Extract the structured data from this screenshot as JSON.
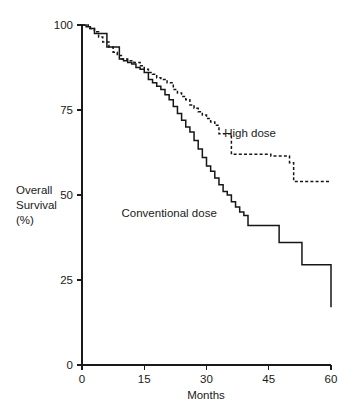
{
  "chart_data": {
    "type": "line",
    "title": "",
    "subtitle": "",
    "xlabel": "Months",
    "ylabel": "Overall Survival (%)",
    "ylabel_lines": [
      "Overall",
      "Survival",
      "(%)"
    ],
    "xlim": [
      0,
      60
    ],
    "ylim": [
      0,
      100
    ],
    "xticks": [
      0,
      15,
      30,
      45,
      60
    ],
    "xtick_labels": [
      "0",
      "15",
      "30",
      "45",
      "60"
    ],
    "yticks": [
      0,
      25,
      50,
      75,
      100
    ],
    "ytick_labels": [
      "0",
      "25",
      "50",
      "75",
      "100"
    ],
    "grid": false,
    "legend_position": "inline-annotations",
    "step_type": "post",
    "series": [
      {
        "name": "High dose",
        "style": "dashed",
        "label_text": "High dose",
        "label_x": 40.5,
        "label_y": 67,
        "x": [
          0,
          1.5,
          3,
          4,
          5,
          6.5,
          7.5,
          8.5,
          9.5,
          11,
          12.5,
          14,
          15,
          16,
          17,
          18,
          19,
          20.5,
          22,
          23,
          24,
          25,
          26,
          27,
          28,
          29,
          30,
          31,
          32,
          33,
          34,
          36,
          37,
          45.5,
          50,
          51,
          60
        ],
        "y": [
          100,
          99,
          98,
          96.5,
          95,
          93.5,
          92,
          91,
          90,
          89.5,
          89,
          88,
          87,
          86,
          85.5,
          84.5,
          84,
          83,
          81,
          80,
          79,
          78,
          76.5,
          75.5,
          74.5,
          73.5,
          72.5,
          71.5,
          70.5,
          68,
          68,
          62,
          62,
          61.5,
          59.5,
          54,
          54
        ]
      },
      {
        "name": "Conventional dose",
        "style": "solid",
        "label_text": "Conventional dose",
        "label_x": 21,
        "label_y": 43.5,
        "x": [
          0,
          1,
          2,
          3,
          5,
          6,
          8,
          9,
          10,
          11,
          12,
          13,
          14,
          15,
          16,
          17,
          18,
          19,
          20,
          21,
          22,
          23,
          24,
          25,
          26,
          27,
          28,
          29,
          30,
          31,
          32,
          33,
          34,
          35,
          36,
          37,
          38,
          39,
          40,
          46.5,
          47.5,
          50,
          53,
          60
        ],
        "y": [
          100,
          99.5,
          99,
          97.5,
          97.5,
          93.5,
          93.5,
          90,
          89.5,
          89,
          88.5,
          87.5,
          87,
          86,
          84,
          83,
          82,
          81,
          79.5,
          78,
          76,
          74,
          72,
          70,
          68.5,
          66,
          63.5,
          61,
          58.5,
          57,
          55,
          53,
          51,
          50,
          48,
          46.5,
          45,
          44,
          41,
          41,
          36,
          36,
          29.5,
          17
        ]
      }
    ],
    "annotations": [
      {
        "text": "High dose",
        "x": 40.5,
        "y": 67
      },
      {
        "text": "Conventional dose",
        "x": 21,
        "y": 43.5
      }
    ]
  },
  "axes": {
    "x_title": "Months",
    "y_title_line1": "Overall",
    "y_title_line2": "Survival",
    "y_title_line3": "(%)"
  },
  "colors": {
    "ink": "#1a1a1a",
    "curve": "#161616",
    "background": "#ffffff"
  }
}
